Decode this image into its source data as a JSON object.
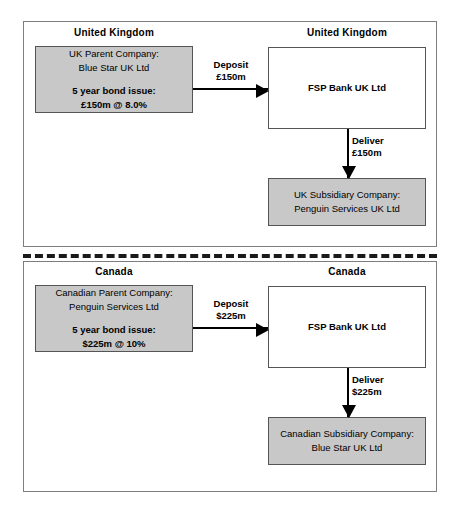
{
  "diagram": {
    "colors": {
      "shaded_node_fill": "#c8c8c8",
      "plain_node_fill": "#ffffff",
      "node_border": "#555555",
      "panel_border": "#7d7d7d",
      "arrow": "#000000",
      "divider": "#1a1a1a"
    },
    "panels": [
      {
        "id": "uk-panel",
        "left_region_label": "United Kingdom",
        "right_region_label": "United Kingdom",
        "parent_node": {
          "line1": "UK Parent Company:",
          "line2": "Blue Star UK Ltd",
          "line3": "5 year bond issue:",
          "line4": "£150m @ 8.0%"
        },
        "bank_node": {
          "line1": "FSP Bank UK Ltd"
        },
        "subsidiary_node": {
          "line1": "UK Subsidiary Company:",
          "line2": "Penguin Services UK Ltd"
        },
        "deposit_edge": {
          "line1": "Deposit",
          "line2": "£150m"
        },
        "deliver_edge": {
          "line1": "Deliver",
          "line2": "£150m"
        }
      },
      {
        "id": "canada-panel",
        "left_region_label": "Canada",
        "right_region_label": "Canada",
        "parent_node": {
          "line1": "Canadian Parent Company:",
          "line2": "Penguin Services Ltd",
          "line3": "5 year bond issue:",
          "line4": "$225m @ 10%"
        },
        "bank_node": {
          "line1": "FSP Bank UK Ltd"
        },
        "subsidiary_node": {
          "line1": "Canadian Subsidiary Company:",
          "line2": "Blue Star UK Ltd"
        },
        "deposit_edge": {
          "line1": "Deposit",
          "line2": "$225m"
        },
        "deliver_edge": {
          "line1": "Deliver",
          "line2": "$225m"
        }
      }
    ]
  }
}
